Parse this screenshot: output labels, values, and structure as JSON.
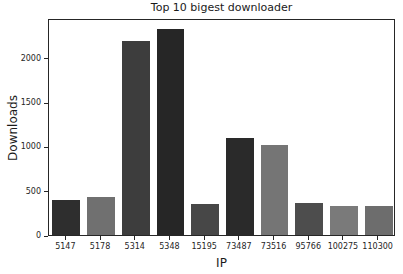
{
  "chart_data": {
    "type": "bar",
    "title": "Top 10 bigest downloader",
    "xlabel": "IP",
    "ylabel": "Downloads",
    "categories": [
      "5147",
      "5178",
      "5314",
      "5348",
      "15195",
      "73487",
      "73516",
      "95766",
      "100275",
      "110300"
    ],
    "values": [
      400,
      430,
      2190,
      2330,
      350,
      1090,
      1020,
      360,
      330,
      325
    ],
    "bar_colors": [
      "#2e2e2e",
      "#707070",
      "#3d3d3d",
      "#262626",
      "#474747",
      "#2a2a2a",
      "#757575",
      "#4d4d4d",
      "#7a7a7a",
      "#6d6d6d"
    ],
    "yticks": [
      0,
      500,
      1000,
      1500,
      2000
    ],
    "ylim": [
      0,
      2450
    ],
    "grid": false,
    "legend": null,
    "bar_width_fraction": 0.8,
    "axis_color": "#262626",
    "background": "#ffffff"
  }
}
